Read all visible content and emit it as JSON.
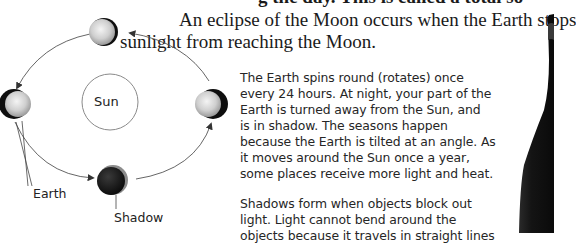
{
  "document": {
    "top_line_partial": "g the day. This is called a total so",
    "heading_lines": [
      "An eclipse of the Moon occurs when the Earth stops",
      "sunlight from reaching the Moon."
    ],
    "paragraphs": [
      [
        "The Earth spins round (rotates) once",
        "every 24 hours. At night, your part of the",
        "Earth is turned away from the Sun, and",
        "is in shadow. The seasons happen",
        "because the Earth is tilted at an angle. As",
        "it moves around the Sun once a year,",
        "some places receive more light and heat."
      ],
      [
        "Shadows form when objects block out",
        "light. Light cannot bend around the",
        "objects because it travels in straight lines"
      ]
    ]
  },
  "diagram": {
    "labels": {
      "sun": "Sun",
      "earth": "Earth",
      "shadow": "Shadow"
    },
    "bodies": [
      "top",
      "left",
      "right",
      "bottom-shadow"
    ],
    "colors": {
      "sun_fill": "#ffffff",
      "sun_stroke": "#7a7a7a",
      "orbit": "#555555",
      "planet_light": "#e8e8e8",
      "planet_dark": "#111111",
      "bottle": "#1b1b1b"
    }
  }
}
